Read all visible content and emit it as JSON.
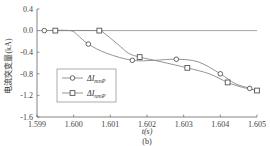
{
  "chart_data": {
    "type": "line",
    "title": "",
    "subtitle": "(b)",
    "xlabel": "t(s)",
    "ylabel": "电流突变量(kA)",
    "xlim": [
      1.599,
      1.605
    ],
    "ylim": [
      -1.6,
      0.4
    ],
    "x_ticks": [
      "1.599",
      "1.600",
      "1.601",
      "1.602",
      "1.603",
      "1.604",
      "1.605"
    ],
    "x_tick_values": [
      1.599,
      1.6,
      1.601,
      1.602,
      1.603,
      1.604,
      1.605
    ],
    "y_ticks": [
      "0.4",
      "0.0",
      "-0.4",
      "-0.8",
      "-1.2",
      "-1.6"
    ],
    "y_tick_values": [
      0.4,
      0.0,
      -0.4,
      -0.8,
      -1.2,
      -1.6
    ],
    "grid": false,
    "legend_position": "bottom-left",
    "reference_line": {
      "y": 0.0,
      "x_range": [
        1.599,
        1.605
      ]
    },
    "series": [
      {
        "name": "ΔI_mnP",
        "label_main": "ΔI",
        "label_sub": "mnP",
        "marker": "circle",
        "x": [
          1.5992,
          1.6004,
          1.6016,
          1.6028,
          1.604,
          1.6048
        ],
        "values": [
          0.0,
          -0.25,
          -0.55,
          -0.53,
          -0.8,
          -1.07
        ],
        "curve": [
          [
            1.5992,
            0.0
          ],
          [
            1.5999,
            0.0
          ],
          [
            1.6001,
            -0.08
          ],
          [
            1.6004,
            -0.25
          ],
          [
            1.6009,
            -0.42
          ],
          [
            1.6016,
            -0.55
          ],
          [
            1.6022,
            -0.55
          ],
          [
            1.6028,
            -0.53
          ],
          [
            1.6034,
            -0.58
          ],
          [
            1.604,
            -0.8
          ],
          [
            1.6044,
            -0.98
          ],
          [
            1.6048,
            -1.07
          ],
          [
            1.605,
            -1.12
          ]
        ]
      },
      {
        "name": "ΔI_nmP",
        "label_main": "ΔI",
        "label_sub": "nmP",
        "marker": "square",
        "x": [
          1.5995,
          1.6007,
          1.6018,
          1.6031,
          1.6042,
          1.605
        ],
        "values": [
          0.0,
          0.0,
          -0.49,
          -0.69,
          -0.96,
          -1.11
        ],
        "curve": [
          [
            1.5995,
            0.0
          ],
          [
            1.6007,
            0.0
          ],
          [
            1.6008,
            -0.03
          ],
          [
            1.6012,
            -0.25
          ],
          [
            1.6015,
            -0.42
          ],
          [
            1.6018,
            -0.49
          ],
          [
            1.6024,
            -0.58
          ],
          [
            1.6031,
            -0.69
          ],
          [
            1.6037,
            -0.8
          ],
          [
            1.6042,
            -0.96
          ],
          [
            1.6046,
            -1.05
          ],
          [
            1.605,
            -1.11
          ],
          [
            1.60505,
            -1.16
          ]
        ]
      }
    ]
  }
}
